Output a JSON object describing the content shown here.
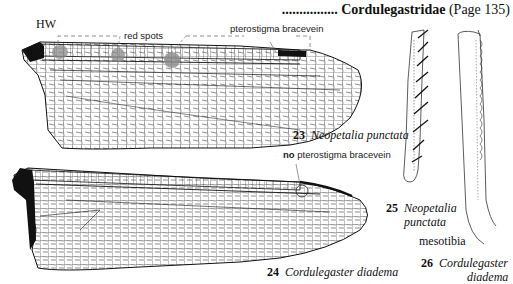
{
  "header": {
    "leader_dots": "................",
    "family": "Cordulegastridae",
    "page_ref": "(Page 135)"
  },
  "wing_23": {
    "label_hw": "HW",
    "annotation_red_spots": "red spots",
    "annotation_pterostigma": "pterostigma bracevein",
    "figure_number": "23",
    "species": "Neopetalia punctata"
  },
  "wing_24": {
    "annotation_no": "no",
    "annotation_pterostigma": "pterostigma bracevein",
    "figure_number": "24",
    "species": "Cordulegaster diadema"
  },
  "tibia_25": {
    "figure_number": "25",
    "species_line1": "Neopetalia",
    "species_line2": "punctata"
  },
  "tibia_label": "mesotibia",
  "tibia_26": {
    "figure_number": "26",
    "species_line1": "Cordulegaster",
    "species_line2": "diadema"
  },
  "colors": {
    "ink": "#111111",
    "red_spot_gray": "#8a8a8a",
    "dashed_line": "#777777"
  }
}
